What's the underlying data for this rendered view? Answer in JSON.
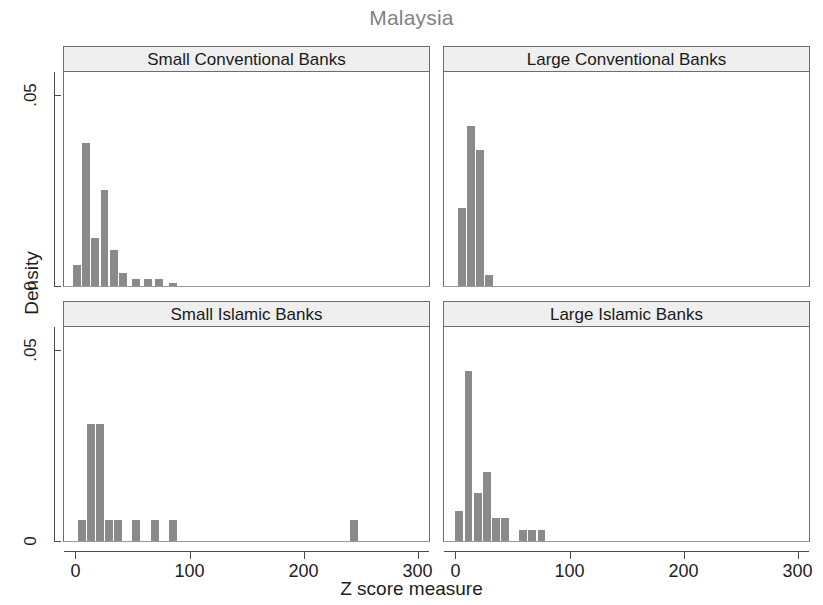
{
  "figure": {
    "title": "Malaysia",
    "xlabel": "Z score measure",
    "ylabel": "Density"
  },
  "axes": {
    "y_ticks": [
      "0",
      ".05"
    ],
    "x_ticks": [
      "0",
      "100",
      "200",
      "300"
    ]
  },
  "panels": [
    {
      "title": "Small Conventional Banks"
    },
    {
      "title": "Large Conventional Banks"
    },
    {
      "title": "Small Islamic Banks"
    },
    {
      "title": "Large Islamic Banks"
    }
  ],
  "colors": {
    "bar": "#8a8a8a",
    "panel_header": "#efefef",
    "frame": "#6d6d6d",
    "title": "#828282",
    "text": "#1d1d1d"
  },
  "chart_data": {
    "type": "bar",
    "title": "Malaysia",
    "xlabel": "Z score measure",
    "ylabel": "Density",
    "xlim": [
      -10,
      310
    ],
    "ylim": [
      0,
      0.056
    ],
    "xticks": [
      0,
      100,
      200,
      300
    ],
    "yticks": [
      0,
      0.05
    ],
    "grid": false,
    "legend": "none",
    "layout": "2x2 facet grid",
    "panels": [
      {
        "title": "Small Conventional Banks",
        "bin_width": 8,
        "bins": [
          {
            "x": 2,
            "density": 0.0055
          },
          {
            "x": 10,
            "density": 0.0375
          },
          {
            "x": 18,
            "density": 0.0125
          },
          {
            "x": 26,
            "density": 0.025
          },
          {
            "x": 34,
            "density": 0.0095
          },
          {
            "x": 42,
            "density": 0.0035
          },
          {
            "x": 54,
            "density": 0.0018
          },
          {
            "x": 64,
            "density": 0.0018
          },
          {
            "x": 74,
            "density": 0.0018
          },
          {
            "x": 86,
            "density": 0.0008
          }
        ]
      },
      {
        "title": "Large Conventional Banks",
        "bin_width": 8,
        "bins": [
          {
            "x": 6,
            "density": 0.0205
          },
          {
            "x": 14,
            "density": 0.042
          },
          {
            "x": 22,
            "density": 0.0355
          },
          {
            "x": 30,
            "density": 0.003
          }
        ]
      },
      {
        "title": "Small Islamic Banks",
        "bin_width": 8,
        "bins": [
          {
            "x": 6,
            "density": 0.0055
          },
          {
            "x": 14,
            "density": 0.0305
          },
          {
            "x": 22,
            "density": 0.0305
          },
          {
            "x": 30,
            "density": 0.0055
          },
          {
            "x": 38,
            "density": 0.0055
          },
          {
            "x": 54,
            "density": 0.0055
          },
          {
            "x": 70,
            "density": 0.0055
          },
          {
            "x": 86,
            "density": 0.0055
          },
          {
            "x": 245,
            "density": 0.0055
          }
        ]
      },
      {
        "title": "Large Islamic Banks",
        "bin_width": 8,
        "bins": [
          {
            "x": 4,
            "density": 0.0078
          },
          {
            "x": 12,
            "density": 0.0445
          },
          {
            "x": 20,
            "density": 0.0125
          },
          {
            "x": 28,
            "density": 0.018
          },
          {
            "x": 36,
            "density": 0.006
          },
          {
            "x": 44,
            "density": 0.006
          },
          {
            "x": 60,
            "density": 0.003
          },
          {
            "x": 68,
            "density": 0.003
          },
          {
            "x": 76,
            "density": 0.003
          }
        ]
      }
    ]
  }
}
